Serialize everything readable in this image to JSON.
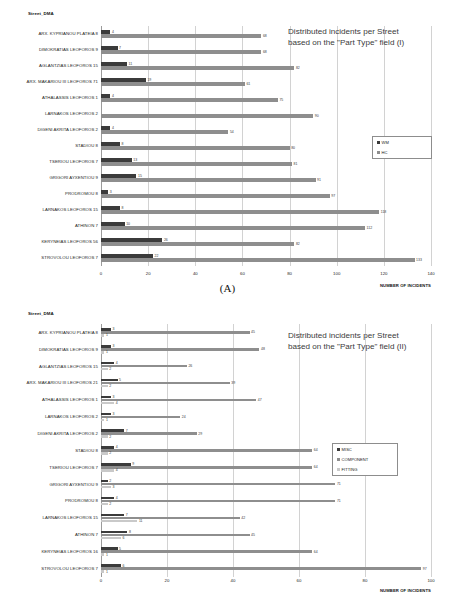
{
  "figure": {
    "panel_a_caption": "(A)",
    "panel_b_caption": "(B)"
  },
  "chart_data": [
    {
      "id": "chart-a",
      "type": "bar",
      "orientation": "horizontal",
      "title": "Distributed incidents per Street\nbased on the \"Part Type\" field (I)",
      "title_line1": "Distributed incidents per Street",
      "title_line2": "based on the \"Part Type\" field (I)",
      "corner_label": "Street_DMA",
      "xlabel": "NUMBER OF INCIDENTS",
      "ylabel": "",
      "xlim": [
        0,
        140
      ],
      "xticks": [
        0,
        20,
        40,
        60,
        80,
        100,
        120,
        140
      ],
      "grid": true,
      "legend_position": "right",
      "categories": [
        "ARX. KYPRIANOU PLATEIA 8",
        "DIMOKRATIAS LEOFOROS 9",
        "AGLANTZIAS LEOFOROS 15",
        "ARX. MAKARIOU III LEOFOROS 71",
        "ATHALASSIS LEOFOROS 1",
        "LARNAKOS LEOFOROS 2",
        "DIGENI AKRITA LEOFOROS 2",
        "STADIOU 8",
        "TSERIOU LEOFOROS 7",
        "GRIGORI AYXENTIOU 9",
        "PRODROMOU 8",
        "LARNAKOS LEOFOROS 15",
        "ATHINON 7",
        "KERYNEIAS LEOFOROS 56",
        "STROVOLOU LEOFOROS 7"
      ],
      "series": [
        {
          "name": "WM",
          "color": "#3b3b3b",
          "values": [
            4,
            7,
            11,
            19,
            4,
            0,
            4,
            8,
            13,
            15,
            3,
            8,
            10,
            26,
            22
          ]
        },
        {
          "name": "HC",
          "color": "#8e8e8e",
          "values": [
            68,
            68,
            82,
            61,
            75,
            90,
            54,
            80,
            81,
            91,
            97,
            118,
            112,
            82,
            133
          ]
        }
      ]
    },
    {
      "id": "chart-b",
      "type": "bar",
      "orientation": "horizontal",
      "title": "Distributed incidents per Street\nbased on the \"Part Type\" field (II)",
      "title_line1": "Distributed incidents per Street",
      "title_line2": "based on the \"Part Type\" field (II)",
      "corner_label": "Street_DMA",
      "xlabel": "NUMBER OF INCIDENTS",
      "ylabel": "",
      "xlim": [
        0,
        100
      ],
      "xticks": [
        0,
        20,
        40,
        60,
        80,
        100
      ],
      "grid": true,
      "legend_position": "right",
      "categories": [
        "ARX. KYPRIANOU PLATEIA 8",
        "DIMOKRATIAS LEOFOROS 9",
        "AGLANTZIAS LEOFOROS 15",
        "ARX. MAKARIOU III LEOFOROS 21",
        "ATHALASSIS LEOFOROS 1",
        "LARNAKOS LEOFOROS 2",
        "DIGENI AKRITA LEOFOROS 2",
        "STADIOU 8",
        "TSERIOU LEOFOROS 7",
        "GRIGORI AYXENTIOU 9",
        "PRODROMOU 8",
        "LARNAKOS LEOFOROS 15",
        "ATHINON 7",
        "KERYNEIAS LEOFOROS 16",
        "STROVOLOU LEOFOROS 7"
      ],
      "series": [
        {
          "name": "MISC",
          "color": "#3b3b3b",
          "values": [
            3,
            3,
            4,
            5,
            3,
            3,
            7,
            4,
            9,
            2,
            4,
            7,
            8,
            5,
            6
          ]
        },
        {
          "name": "COMPONENT",
          "color": "#8e8e8e",
          "values": [
            45,
            48,
            26,
            39,
            47,
            24,
            29,
            64,
            64,
            71,
            71,
            42,
            45,
            64,
            97
          ]
        },
        {
          "name": "FITTING",
          "color": "#c9c9c9",
          "values": [
            1,
            1,
            2,
            2,
            4,
            1,
            2,
            2,
            4,
            3,
            2,
            11,
            6,
            1,
            1
          ]
        }
      ]
    }
  ]
}
